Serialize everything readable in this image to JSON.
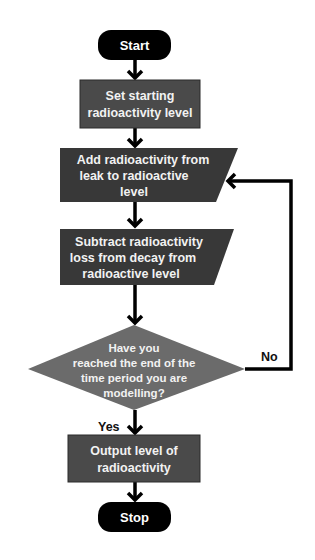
{
  "colors": {
    "terminal": "#000000",
    "process": "#4a4a4a",
    "io": "#383838",
    "decision": "#6b6b6b",
    "line": "#000000",
    "text_on_shape": "#f2f2f2"
  },
  "nodes": {
    "start": {
      "type": "terminal",
      "text": "Start"
    },
    "set_level": {
      "type": "process",
      "lines": [
        "Set starting",
        "radioactivity level"
      ]
    },
    "add_leak": {
      "type": "io",
      "lines": [
        "Add radioactivity from",
        "leak to radioactive",
        "level"
      ]
    },
    "subtract_decay": {
      "type": "io",
      "lines": [
        "Subtract radioactivity",
        "loss from decay from",
        "radioactive level"
      ]
    },
    "decision": {
      "type": "decision",
      "lines": [
        "Have you",
        "reached the end of the",
        "time period you are",
        "modelling?"
      ]
    },
    "output": {
      "type": "process",
      "lines": [
        "Output level of",
        "radioactivity"
      ]
    },
    "stop": {
      "type": "terminal",
      "text": "Stop"
    }
  },
  "edges": {
    "yes_label": "Yes",
    "no_label": "No"
  }
}
